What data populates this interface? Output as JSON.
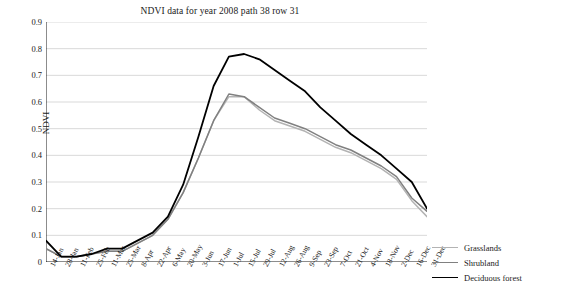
{
  "chart_data": {
    "type": "line",
    "title": "NDVI data for year 2008 path 38 row 31",
    "xlabel": "",
    "ylabel": "NDVI",
    "ylim": [
      0,
      0.9
    ],
    "ytick_values": [
      0,
      0.1,
      0.2,
      0.3,
      0.4,
      0.5,
      0.6,
      0.7,
      0.8,
      0.9
    ],
    "ytick_labels": [
      "0",
      "0.1",
      "0.2",
      "0.3",
      "0.4",
      "0.5",
      "0.6",
      "0.7",
      "0.8",
      "0.9"
    ],
    "grid": "horizontal",
    "legend_position": "right-bottom",
    "categories": [
      "14-Jan",
      "28-Jan",
      "11-Feb",
      "25-Feb",
      "11-Mar",
      "25-Mar",
      "8-Apr",
      "22-Apr",
      "6-May",
      "20-May",
      "3-Jun",
      "17-Jun",
      "1-Jul",
      "15-Jul",
      "29-Jul",
      "12-Aug",
      "26-Aug",
      "9-Sep",
      "23-Sep",
      "7-Oct",
      "21-Oct",
      "4-Nov",
      "18-Nov",
      "2-Dec",
      "16-Dec",
      "31-Dec"
    ],
    "series": [
      {
        "name": "Grasslands",
        "color": "#b3b3b3",
        "values": [
          0.05,
          0.02,
          0.02,
          0.03,
          0.04,
          0.04,
          0.07,
          0.1,
          0.16,
          0.26,
          0.39,
          0.53,
          0.62,
          0.62,
          0.57,
          0.53,
          0.51,
          0.49,
          0.46,
          0.43,
          0.41,
          0.38,
          0.35,
          0.31,
          0.23,
          0.17
        ]
      },
      {
        "name": "Shrubland",
        "color": "#808080",
        "values": [
          0.05,
          0.02,
          0.02,
          0.03,
          0.04,
          0.04,
          0.07,
          0.1,
          0.16,
          0.26,
          0.39,
          0.53,
          0.63,
          0.62,
          0.58,
          0.54,
          0.52,
          0.5,
          0.47,
          0.44,
          0.42,
          0.39,
          0.36,
          0.32,
          0.24,
          0.19
        ]
      },
      {
        "name": "Deciduous forest",
        "color": "#000000",
        "values": [
          0.08,
          0.02,
          0.02,
          0.03,
          0.05,
          0.05,
          0.08,
          0.11,
          0.17,
          0.29,
          0.47,
          0.66,
          0.77,
          0.78,
          0.76,
          0.72,
          0.68,
          0.64,
          0.58,
          0.53,
          0.48,
          0.44,
          0.4,
          0.35,
          0.3,
          0.2
        ]
      }
    ]
  }
}
